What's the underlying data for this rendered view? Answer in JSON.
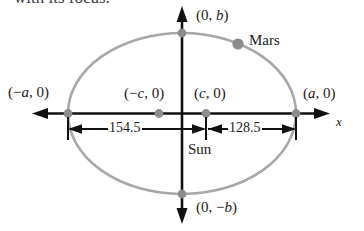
{
  "figure": {
    "caption_fragment": "with its focus.",
    "colors": {
      "ellipse_curve": "#a8a8a8",
      "point_marker": "#8c8c8c",
      "axis": "#111111",
      "dimension_line": "#111111",
      "text": "#1a1a1a",
      "background": "#ffffff"
    }
  },
  "axes": {
    "x_axis_label": "x",
    "y_axis_label": ""
  },
  "labels": {
    "top_vertex": "(0, b)",
    "bottom_vertex": "(0, −b)",
    "left_vertex": "(−a, 0)",
    "right_vertex": "(a, 0)",
    "left_focus": "(−c, 0)",
    "right_focus": "(c, 0)",
    "sun": "Sun",
    "mars": "Mars"
  },
  "dimensions": {
    "left_segment_value": "154.5",
    "right_segment_value": "128.5"
  },
  "chart_data": {
    "type": "scatter",
    "xlabel": "x",
    "ylabel": "",
    "grid": false,
    "legend": false,
    "shape": "ellipse",
    "center": [
      0,
      0
    ],
    "semi_major_axis_symbol": "a",
    "semi_minor_axis_symbol": "b",
    "focal_distance_symbol": "c",
    "annotations": [
      {
        "label": "(0, b)",
        "role": "top-vertex",
        "x": 0,
        "y": 1
      },
      {
        "label": "(0, −b)",
        "role": "bottom-vertex",
        "x": 0,
        "y": -1
      },
      {
        "label": "(−a, 0)",
        "role": "left-vertex",
        "x": -1,
        "y": 0
      },
      {
        "label": "(a, 0)",
        "role": "right-vertex",
        "x": 1,
        "y": 0
      },
      {
        "label": "(−c, 0)",
        "role": "left-focus",
        "x": -0.2,
        "y": 0
      },
      {
        "label": "(c, 0)",
        "role": "right-focus",
        "x": 0.2,
        "y": 0
      },
      {
        "label": "Sun",
        "role": "sun-at-right-focus",
        "x": 0.2,
        "y": 0
      },
      {
        "label": "Mars",
        "role": "planet-on-orbit",
        "x": 0.49,
        "y": 0.86
      }
    ],
    "measurements": [
      {
        "label": "154.5",
        "from": "(−a, 0)",
        "to": "(c, 0)",
        "value": 154.5
      },
      {
        "label": "128.5",
        "from": "(c, 0)",
        "to": "(a, 0)",
        "value": 128.5
      }
    ]
  }
}
